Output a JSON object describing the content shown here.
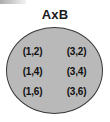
{
  "diagram": {
    "title": "AxB",
    "type": "venn-set-ellipse",
    "set_a": [
      1,
      3
    ],
    "set_b": [
      2,
      4,
      6
    ],
    "fill_color": "#b9b9b9",
    "outline_color": "#3a3a3a",
    "text_color": "#111111",
    "background_color": "#ffffff",
    "rows": [
      {
        "left": "(1,2)",
        "right": "(3,2)"
      },
      {
        "left": "(1,4)",
        "right": "(3,4)"
      },
      {
        "left": "(1,6)",
        "right": "(3,6)"
      }
    ]
  }
}
